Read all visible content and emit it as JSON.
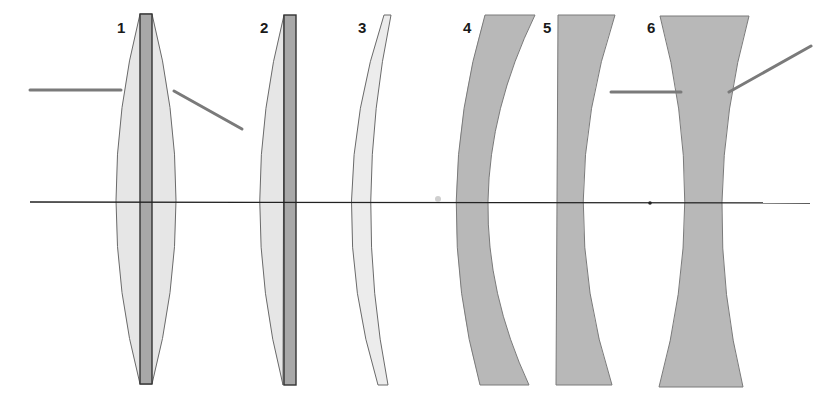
{
  "diagram": {
    "colors": {
      "background": "#ffffff",
      "light_glass": "#e6e6e6",
      "dark_glass": "#b8b8b8",
      "cement_layer": "#a8a8a8",
      "outline": "#6a6a6a",
      "axis": "#222222",
      "ray": "#7a7a7a"
    },
    "lenses": [
      {
        "label": "1",
        "type": "cemented biconvex"
      },
      {
        "label": "2",
        "type": "cemented plano-convex"
      },
      {
        "label": "3",
        "type": "positive meniscus"
      },
      {
        "label": "4",
        "type": "negative meniscus"
      },
      {
        "label": "5",
        "type": "plano-concave"
      },
      {
        "label": "6",
        "type": "biconcave"
      }
    ],
    "rays": [
      {
        "name": "converging-ray",
        "lens": "1"
      },
      {
        "name": "diverging-ray",
        "lens": "6"
      }
    ],
    "optical_axis": true
  }
}
